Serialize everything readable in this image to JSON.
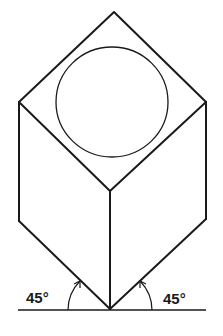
{
  "diagram": {
    "type": "isometric-cube-projection",
    "colors": {
      "stroke": "#1a1a1a",
      "background": "#ffffff"
    },
    "vertices": {
      "top": [
        114,
        12
      ],
      "left_top": [
        19,
        102
      ],
      "right_top": [
        206,
        102
      ],
      "center": [
        110,
        191
      ],
      "left_bottom": [
        19,
        221
      ],
      "right_bottom": [
        206,
        219
      ],
      "bottom": [
        110,
        309
      ]
    },
    "circle": {
      "cx": 112,
      "cy": 102,
      "rx": 56,
      "ry": 55
    },
    "baseline": {
      "x1": 18,
      "x2": 206,
      "y": 310
    },
    "angles": [
      {
        "id": "left",
        "label": "45°",
        "label_pos": [
          26,
          303
        ]
      },
      {
        "id": "right",
        "label": "45°",
        "label_pos": [
          163,
          304
        ]
      }
    ]
  }
}
